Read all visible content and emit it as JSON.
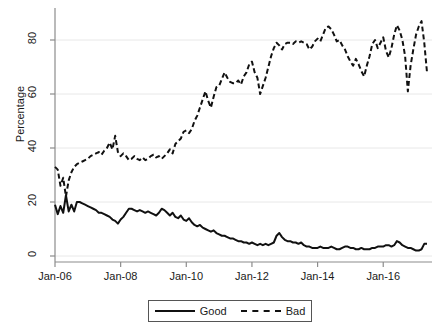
{
  "chart_data": {
    "type": "line",
    "title": "",
    "xlabel": "",
    "ylabel": "Percentage",
    "ylim": [
      0,
      90
    ],
    "yticks": [
      0,
      20,
      40,
      60,
      80
    ],
    "ytick_labels": [
      "0",
      "20",
      "40",
      "60",
      "80"
    ],
    "xlim": [
      "Jan-06",
      "Jul-16"
    ],
    "xticks": [
      "Jan-06",
      "Jan-08",
      "Jan-10",
      "Jan-12",
      "Jan-14",
      "Jan-16"
    ],
    "xtick_labels": [
      "Jan-06",
      "Jan-08",
      "Jan-10",
      "Jan-12",
      "Jan-14",
      "Jan-16"
    ],
    "grid": "horizontal",
    "legend_position": "below-center",
    "legend": [
      "Good",
      "Bad"
    ],
    "series": [
      {
        "name": "Good",
        "style": "solid",
        "color": "#111111",
        "values": [
          19.0,
          15.5,
          18.5,
          16.0,
          22.5,
          16.5,
          19.0,
          16.5,
          20.0,
          20.0,
          19.5,
          19.0,
          18.5,
          18.0,
          17.5,
          17.0,
          16.0,
          16.0,
          15.5,
          15.0,
          14.5,
          13.5,
          13.0,
          12.0,
          13.5,
          14.5,
          16.0,
          17.5,
          17.5,
          17.0,
          16.5,
          17.0,
          16.5,
          16.0,
          16.5,
          16.0,
          15.5,
          15.0,
          16.0,
          17.5,
          17.0,
          16.0,
          15.0,
          16.0,
          14.5,
          14.0,
          15.0,
          13.5,
          13.0,
          14.0,
          12.5,
          11.5,
          11.0,
          11.5,
          10.5,
          10.0,
          9.5,
          9.0,
          9.5,
          8.5,
          8.0,
          7.5,
          7.5,
          7.0,
          6.5,
          6.5,
          6.0,
          5.5,
          5.5,
          5.0,
          5.0,
          4.5,
          5.0,
          4.5,
          4.0,
          4.5,
          4.0,
          4.5,
          4.0,
          4.5,
          5.0,
          7.5,
          8.5,
          7.0,
          6.0,
          5.5,
          5.5,
          5.0,
          5.0,
          4.5,
          5.0,
          4.0,
          3.5,
          3.5,
          3.0,
          3.0,
          3.0,
          3.5,
          3.0,
          3.0,
          3.0,
          3.5,
          3.0,
          2.5,
          2.5,
          3.0,
          3.5,
          3.5,
          3.0,
          3.0,
          2.5,
          2.5,
          3.0,
          2.5,
          2.5,
          2.5,
          3.0,
          3.0,
          3.5,
          3.5,
          3.5,
          4.0,
          4.0,
          3.5,
          4.0,
          5.5,
          5.0,
          4.0,
          3.5,
          3.0,
          3.0,
          2.5,
          2.0,
          2.0,
          2.5,
          4.5,
          4.5
        ]
      },
      {
        "name": "Bad",
        "style": "dashed",
        "color": "#111111",
        "values": [
          33.0,
          32.0,
          26.0,
          29.0,
          22.0,
          28.0,
          31.0,
          33.0,
          34.0,
          34.5,
          35.0,
          35.5,
          36.0,
          37.0,
          37.5,
          38.0,
          38.5,
          37.5,
          39.0,
          40.0,
          42.0,
          39.5,
          44.5,
          38.5,
          37.0,
          38.0,
          37.0,
          35.5,
          36.0,
          37.0,
          36.0,
          35.5,
          36.5,
          35.5,
          36.0,
          37.0,
          37.5,
          36.5,
          37.0,
          36.0,
          37.0,
          38.0,
          39.5,
          38.0,
          41.5,
          42.5,
          43.5,
          46.0,
          46.5,
          45.5,
          47.0,
          50.0,
          52.0,
          55.0,
          58.0,
          61.0,
          57.5,
          55.0,
          59.0,
          62.5,
          63.0,
          65.5,
          68.0,
          66.0,
          64.5,
          64.0,
          64.0,
          65.0,
          63.5,
          66.5,
          68.0,
          71.0,
          72.0,
          68.0,
          66.0,
          60.0,
          63.0,
          66.0,
          70.0,
          74.0,
          77.0,
          79.0,
          78.0,
          76.5,
          78.5,
          79.0,
          79.0,
          78.5,
          79.5,
          79.0,
          79.5,
          79.0,
          78.5,
          76.5,
          77.5,
          79.5,
          80.5,
          79.5,
          82.0,
          84.5,
          85.0,
          84.0,
          82.0,
          79.5,
          80.0,
          78.0,
          76.5,
          74.0,
          72.0,
          70.5,
          73.0,
          71.0,
          68.5,
          66.5,
          70.5,
          74.0,
          78.5,
          80.0,
          77.0,
          79.0,
          81.0,
          76.0,
          73.5,
          77.0,
          82.0,
          85.5,
          83.5,
          80.0,
          74.0,
          61.0,
          70.5,
          76.5,
          82.0,
          85.0,
          87.0,
          79.0,
          68.0
        ]
      }
    ]
  },
  "axis": {
    "ylabel": "Percentage",
    "ytick_labels": [
      "0",
      "20",
      "40",
      "60",
      "80"
    ],
    "xtick_labels": [
      "Jan-06",
      "Jan-08",
      "Jan-10",
      "Jan-12",
      "Jan-14",
      "Jan-16"
    ]
  },
  "legend": {
    "items": [
      {
        "label": "Good",
        "style": "solid"
      },
      {
        "label": "Bad",
        "style": "dashed"
      }
    ]
  },
  "colors": {
    "line": "#111111",
    "grid": "#e8e8e8",
    "axis": "#8c8c8c",
    "text": "#1a1a1a"
  }
}
